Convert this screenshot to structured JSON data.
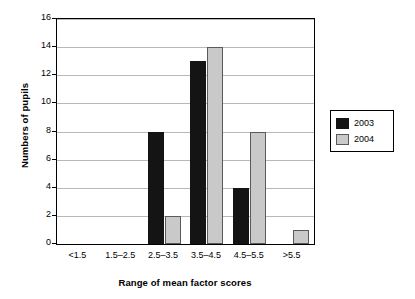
{
  "chart_data": {
    "type": "bar",
    "title": "",
    "xlabel": "Range of mean factor scores",
    "ylabel": "Numbers of pupils",
    "categories": [
      "<1.5",
      "1.5–2.5",
      "2.5–3.5",
      "3.5–4.5",
      "4.5–5.5",
      ">5.5"
    ],
    "series": [
      {
        "name": "2003",
        "values": [
          0,
          0,
          8,
          13,
          4,
          0
        ],
        "color": "#141414"
      },
      {
        "name": "2004",
        "values": [
          0,
          0,
          2,
          14,
          8,
          1
        ],
        "color": "#c9c9c9"
      }
    ],
    "ylim": [
      0,
      16
    ],
    "yticks": [
      0,
      2,
      4,
      6,
      8,
      10,
      12,
      14,
      16
    ],
    "ytick_labels": [
      "0",
      "2",
      "4",
      "6",
      "8",
      "10",
      "12",
      "14",
      "16"
    ],
    "grid": true,
    "legend_position": "right"
  }
}
